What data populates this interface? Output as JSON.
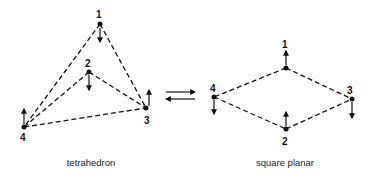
{
  "diagram": {
    "tetrahedron": {
      "caption": "tetrahedron",
      "vertices": [
        {
          "id": "1",
          "x": 100,
          "y": 24,
          "lx": 100,
          "ly": 17,
          "arrow": "down"
        },
        {
          "id": "2",
          "x": 89,
          "y": 72,
          "lx": 88,
          "ly": 66,
          "arrow": "down"
        },
        {
          "id": "3",
          "x": 146,
          "y": 108,
          "lx": 147,
          "ly": 124,
          "arrow": "up"
        },
        {
          "id": "4",
          "x": 24,
          "y": 127,
          "lx": 23,
          "ly": 141,
          "arrow": "up"
        }
      ],
      "edges": [
        [
          "1",
          "4"
        ],
        [
          "1",
          "3"
        ],
        [
          "2",
          "4"
        ],
        [
          "2",
          "3"
        ],
        [
          "4",
          "3"
        ]
      ]
    },
    "equilibrium": {
      "forward": "right",
      "reverse": "left"
    },
    "square_planar": {
      "caption": "square planar",
      "vertices": [
        {
          "id": "1",
          "x": 286,
          "y": 68,
          "lx": 285,
          "ly": 51,
          "arrow": "up"
        },
        {
          "id": "2",
          "x": 286,
          "y": 129,
          "lx": 286,
          "ly": 145,
          "arrow": "up"
        },
        {
          "id": "3",
          "x": 352,
          "y": 99,
          "lx": 351,
          "ly": 94,
          "arrow": "down"
        },
        {
          "id": "4",
          "x": 214,
          "y": 97,
          "lx": 214,
          "ly": 91,
          "arrow": "down"
        }
      ],
      "edges": [
        [
          "1",
          "4"
        ],
        [
          "1",
          "3"
        ],
        [
          "4",
          "2"
        ],
        [
          "2",
          "3"
        ]
      ]
    }
  }
}
